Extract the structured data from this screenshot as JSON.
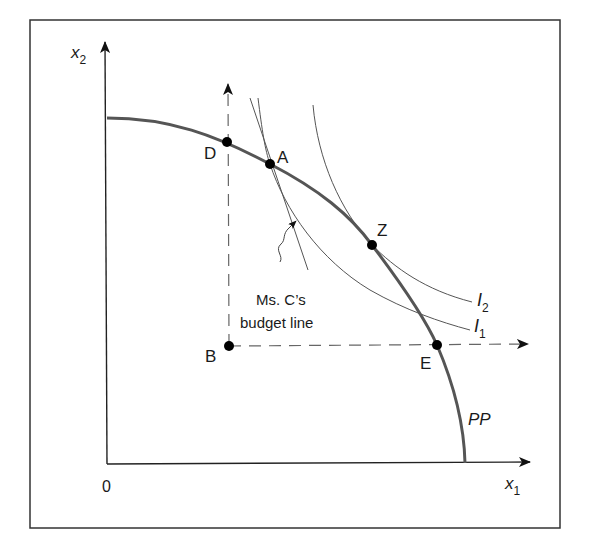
{
  "figure": {
    "type": "production-possibility-frontier-diagram",
    "axes": {
      "x_label": "x",
      "x_label_sub": "1",
      "y_label": "x",
      "y_label_sub": "2",
      "origin_label": "0"
    },
    "curves": {
      "ppf_label": "PP",
      "indifference_1_label": "I",
      "indifference_1_sub": "1",
      "indifference_2_label": "I",
      "indifference_2_sub": "2"
    },
    "points": [
      {
        "id": "D",
        "label": "D"
      },
      {
        "id": "A",
        "label": "A"
      },
      {
        "id": "Z",
        "label": "Z"
      },
      {
        "id": "E",
        "label": "E"
      },
      {
        "id": "B",
        "label": "B"
      }
    ],
    "annotation": {
      "line1": "Ms. C’s",
      "line2": "budget line"
    },
    "colors": {
      "frame": "#333333",
      "ppf": "#555555",
      "curves": "#555555",
      "dashed": "#666666",
      "points": "#000000"
    }
  }
}
